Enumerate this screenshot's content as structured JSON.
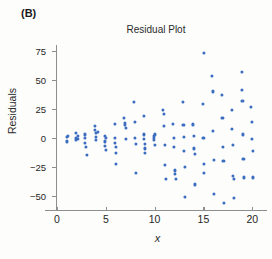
{
  "panel": {
    "label": "(B)"
  },
  "chart_data": {
    "type": "scatter",
    "title": "Residual Plot",
    "xlabel": "x",
    "ylabel": "Residuals",
    "grid": false,
    "legend": null,
    "xlim": [
      0,
      21
    ],
    "ylim": [
      -62,
      80
    ],
    "xticks": [
      0,
      5,
      10,
      15,
      20
    ],
    "xtick_labels": [
      "0",
      "5",
      "10",
      "15",
      "20"
    ],
    "yticks": [
      75,
      50,
      25,
      0,
      -25,
      -50
    ],
    "ytick_labels": [
      "75",
      "50",
      "25",
      "0",
      "−25",
      "−50"
    ],
    "point_color": "#3a6cc0",
    "axis_color": "#8e8e8e",
    "annotation": "Residual spread widens as x increases (fan / megaphone pattern indicating non-constant variance).",
    "points": [
      [
        1.0,
        1
      ],
      [
        1.0,
        -3
      ],
      [
        1.1,
        2
      ],
      [
        1.9,
        4
      ],
      [
        1.9,
        0
      ],
      [
        1.9,
        -2
      ],
      [
        2.1,
        2
      ],
      [
        2.1,
        -1
      ],
      [
        2.9,
        3
      ],
      [
        2.9,
        0
      ],
      [
        2.9,
        -4
      ],
      [
        3.0,
        -8
      ],
      [
        3.05,
        -15
      ],
      [
        3.9,
        10
      ],
      [
        3.9,
        7
      ],
      [
        3.95,
        4
      ],
      [
        3.95,
        1
      ],
      [
        4.0,
        -2
      ],
      [
        4.2,
        5
      ],
      [
        4.9,
        2
      ],
      [
        4.9,
        -3
      ],
      [
        4.95,
        -7
      ],
      [
        5.0,
        -10
      ],
      [
        5.0,
        0
      ],
      [
        5.9,
        12
      ],
      [
        5.95,
        0
      ],
      [
        5.95,
        -4
      ],
      [
        6.0,
        -8
      ],
      [
        6.0,
        -13
      ],
      [
        6.05,
        -22
      ],
      [
        6.9,
        17
      ],
      [
        7.0,
        13
      ],
      [
        7.0,
        11
      ],
      [
        7.05,
        9
      ],
      [
        7.1,
        -1
      ],
      [
        7.9,
        31
      ],
      [
        7.95,
        14
      ],
      [
        8.0,
        0
      ],
      [
        8.05,
        -5
      ],
      [
        8.1,
        -30
      ],
      [
        8.9,
        19
      ],
      [
        8.95,
        3
      ],
      [
        8.95,
        -1
      ],
      [
        9.0,
        -5
      ],
      [
        9.0,
        -9
      ],
      [
        9.05,
        -13
      ],
      [
        9.9,
        2
      ],
      [
        9.95,
        0
      ],
      [
        9.95,
        -2
      ],
      [
        10.0,
        -6
      ],
      [
        10.05,
        3
      ],
      [
        10.9,
        24
      ],
      [
        10.95,
        21
      ],
      [
        11.0,
        10
      ],
      [
        11.05,
        -6
      ],
      [
        11.1,
        -23
      ],
      [
        11.15,
        -35
      ],
      [
        11.9,
        12
      ],
      [
        11.95,
        0
      ],
      [
        12.0,
        -8
      ],
      [
        12.05,
        -28
      ],
      [
        12.1,
        -31
      ],
      [
        12.15,
        -35
      ],
      [
        12.9,
        31
      ],
      [
        12.95,
        11
      ],
      [
        13.0,
        1
      ],
      [
        13.05,
        -11
      ],
      [
        13.1,
        -25
      ],
      [
        13.15,
        -51
      ],
      [
        13.9,
        12
      ],
      [
        13.95,
        11
      ],
      [
        14.0,
        2
      ],
      [
        14.05,
        -9
      ],
      [
        14.1,
        -14
      ],
      [
        14.15,
        -40
      ],
      [
        15.05,
        73
      ],
      [
        14.95,
        29
      ],
      [
        15.0,
        0
      ],
      [
        15.05,
        -22
      ],
      [
        15.1,
        -30
      ],
      [
        15.9,
        53
      ],
      [
        15.95,
        40
      ],
      [
        16.0,
        6
      ],
      [
        16.05,
        -19
      ],
      [
        16.1,
        -48
      ],
      [
        16.9,
        37
      ],
      [
        16.95,
        17
      ],
      [
        17.0,
        -8
      ],
      [
        17.05,
        -20
      ],
      [
        17.1,
        -56
      ],
      [
        17.9,
        24
      ],
      [
        17.95,
        8
      ],
      [
        18.0,
        -6
      ],
      [
        18.05,
        -33
      ],
      [
        18.1,
        -35
      ],
      [
        18.15,
        -52
      ],
      [
        18.9,
        57
      ],
      [
        18.95,
        41
      ],
      [
        19.0,
        32
      ],
      [
        19.05,
        3
      ],
      [
        19.1,
        -18
      ],
      [
        19.15,
        -34
      ],
      [
        19.9,
        27
      ],
      [
        19.95,
        14
      ],
      [
        20.0,
        -1
      ],
      [
        20.05,
        -11
      ],
      [
        20.1,
        -34
      ]
    ]
  }
}
